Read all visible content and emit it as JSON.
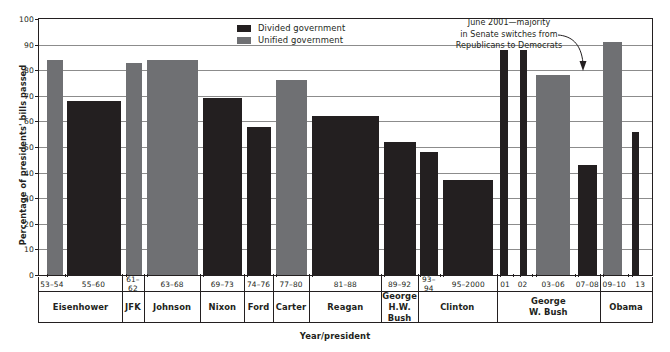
{
  "chart_data": {
    "type": "bar",
    "title": "",
    "xlabel": "Year/president",
    "ylabel": "Percentage of presidents' bills passed",
    "ylim": [
      0,
      100
    ],
    "ytick_step": 10,
    "yticks": [
      0,
      10,
      20,
      30,
      40,
      50,
      60,
      70,
      80,
      90,
      100
    ],
    "grid": true,
    "legend_position": "top-center",
    "legend": [
      {
        "key": "divided",
        "label": "Divided government",
        "color": "#231f20"
      },
      {
        "key": "unified",
        "label": "Unified government",
        "color": "#6f7073"
      }
    ],
    "annotations": [
      {
        "name": "senate-switch-note",
        "lines": [
          "June 2001—majority",
          "in Senate switches from",
          "Republicans to Democrats"
        ],
        "points_to": "01"
      }
    ],
    "categories": [
      "53–54",
      "55–60",
      "61–62",
      "63–68",
      "69–73",
      "74–76",
      "77–80",
      "81–88",
      "89–92",
      "93–94",
      "95–2000",
      "01",
      "02",
      "03–06",
      "07–08",
      "09–10",
      "13"
    ],
    "values": [
      84,
      68,
      83,
      84,
      69,
      58,
      76,
      62,
      52,
      48,
      37,
      88,
      88,
      78,
      43,
      91,
      56
    ],
    "series_of": [
      "unified",
      "divided",
      "unified",
      "unified",
      "divided",
      "divided",
      "unified",
      "divided",
      "divided",
      "divided",
      "divided",
      "divided",
      "divided",
      "unified",
      "divided",
      "unified",
      "divided"
    ],
    "bars": [
      {
        "label": "53–54",
        "value": 84,
        "type": "unified",
        "x": 2.0,
        "w": 4.2
      },
      {
        "label": "55–60",
        "value": 68,
        "type": "divided",
        "x": 7.5,
        "w": 14.0
      },
      {
        "label": "61–62",
        "value": 83,
        "type": "unified",
        "x": 23.0,
        "w": 4.2
      },
      {
        "label": "63–68",
        "value": 84,
        "type": "unified",
        "x": 28.4,
        "w": 13.5
      },
      {
        "label": "69–73",
        "value": 69,
        "type": "divided",
        "x": 43.2,
        "w": 10.2
      },
      {
        "label": "74–76",
        "value": 58,
        "type": "divided",
        "x": 54.7,
        "w": 6.4
      },
      {
        "label": "77–80",
        "value": 76,
        "type": "unified",
        "x": 62.4,
        "w": 8.2
      },
      {
        "label": "81–88",
        "value": 62,
        "type": "divided",
        "x": 72.0,
        "w": 17.6
      },
      {
        "label": "89–92",
        "value": 52,
        "type": "divided",
        "x": 91.0,
        "w": 8.4
      },
      {
        "label": "93–94",
        "value": 48,
        "type": "divided",
        "x": 100.5,
        "w": 4.6
      },
      {
        "label": "95–2000",
        "value": 37,
        "type": "divided",
        "x": 106.4,
        "w": 13.2
      },
      {
        "label": "01",
        "value": 88,
        "type": "divided",
        "x": 121.5,
        "w": 2.0
      },
      {
        "label": "02",
        "value": 88,
        "type": "divided",
        "x": 126.6,
        "w": 2.0
      },
      {
        "label": "03–06",
        "value": 78,
        "type": "unified",
        "x": 131.0,
        "w": 9.0
      },
      {
        "label": "07–08",
        "value": 43,
        "type": "divided",
        "x": 142.0,
        "w": 5.0
      },
      {
        "label": "09–10",
        "value": 91,
        "type": "unified",
        "x": 148.7,
        "w": 5.0
      },
      {
        "label": "13",
        "value": 56,
        "type": "divided",
        "x": 156.2,
        "w": 1.9
      }
    ],
    "year_cells": [
      {
        "label": "53–54",
        "start": 0.0,
        "end": 6.8
      },
      {
        "label": "55–60",
        "start": 6.8,
        "end": 21.9
      },
      {
        "label": "61–62",
        "start": 21.9,
        "end": 27.6
      },
      {
        "label": "63–68",
        "start": 27.6,
        "end": 42.5
      },
      {
        "label": "69–73",
        "start": 42.5,
        "end": 54.1
      },
      {
        "label": "74–76",
        "start": 54.1,
        "end": 61.6
      },
      {
        "label": "77–80",
        "start": 61.6,
        "end": 71.2
      },
      {
        "label": "81–88",
        "start": 71.2,
        "end": 90.2
      },
      {
        "label": "89–92",
        "start": 90.2,
        "end": 99.8
      },
      {
        "label": "93–94",
        "start": 99.8,
        "end": 105.6
      },
      {
        "label": "95–2000",
        "start": 105.6,
        "end": 120.6
      },
      {
        "label": "01",
        "start": 120.6,
        "end": 125.0
      },
      {
        "label": "02",
        "start": 125.0,
        "end": 129.8
      },
      {
        "label": "03–06",
        "start": 129.8,
        "end": 141.1
      },
      {
        "label": "07–08",
        "start": 141.1,
        "end": 147.8
      },
      {
        "label": "09–10",
        "start": 147.8,
        "end": 155.3
      },
      {
        "label": "13",
        "start": 155.3,
        "end": 161.5
      }
    ],
    "president_cells": [
      {
        "line1": "Eisenhower",
        "line2": "",
        "start": 0.0,
        "end": 21.9
      },
      {
        "line1": "JFK",
        "line2": "",
        "start": 21.9,
        "end": 27.6
      },
      {
        "line1": "Johnson",
        "line2": "",
        "start": 27.6,
        "end": 42.5
      },
      {
        "line1": "Nixon",
        "line2": "",
        "start": 42.5,
        "end": 54.1
      },
      {
        "line1": "Ford",
        "line2": "",
        "start": 54.1,
        "end": 61.6
      },
      {
        "line1": "Carter",
        "line2": "",
        "start": 61.6,
        "end": 71.2
      },
      {
        "line1": "Reagan",
        "line2": "",
        "start": 71.2,
        "end": 90.2
      },
      {
        "line1": "George",
        "line2": "H.W. Bush",
        "start": 90.2,
        "end": 99.8
      },
      {
        "line1": "Clinton",
        "line2": "",
        "start": 99.8,
        "end": 120.6
      },
      {
        "line1": "George",
        "line2": "W. Bush",
        "start": 120.6,
        "end": 147.8
      },
      {
        "line1": "Obama",
        "line2": "",
        "start": 147.8,
        "end": 161.5
      }
    ]
  }
}
